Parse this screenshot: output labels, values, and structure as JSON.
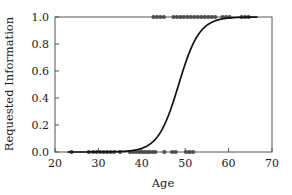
{
  "chart_data": {
    "type": "scatter",
    "title": "",
    "xlabel": "Age",
    "ylabel": "Requested Information",
    "xlim": [
      20,
      70
    ],
    "ylim": [
      0.0,
      1.0
    ],
    "grid": false,
    "legend": null,
    "xticks": [
      "20",
      "30",
      "40",
      "50",
      "60",
      "70"
    ],
    "xtick_values": [
      20,
      30,
      40,
      50,
      60,
      70
    ],
    "yticks": [
      "0.0",
      "0.2",
      "0.4",
      "0.6",
      "0.8",
      "1.0"
    ],
    "ytick_values": [
      0.0,
      0.2,
      0.4,
      0.6,
      0.8,
      1.0
    ],
    "series": [
      {
        "name": "Observed outcomes",
        "type": "scatter",
        "marker": "filled-circle",
        "color": "#4d4d4d",
        "points": [
          [
            23.8,
            0
          ],
          [
            27.8,
            0
          ],
          [
            28.8,
            0
          ],
          [
            29.6,
            0
          ],
          [
            30.4,
            0
          ],
          [
            31.2,
            0
          ],
          [
            32.0,
            0
          ],
          [
            32.8,
            0
          ],
          [
            33.6,
            0
          ],
          [
            35.0,
            0
          ],
          [
            37.3,
            0
          ],
          [
            38.0,
            0
          ],
          [
            38.7,
            0
          ],
          [
            39.4,
            0
          ],
          [
            40.0,
            0
          ],
          [
            40.6,
            0
          ],
          [
            41.2,
            0
          ],
          [
            41.8,
            0
          ],
          [
            42.5,
            0
          ],
          [
            43.1,
            0
          ],
          [
            45.2,
            0
          ],
          [
            47.0,
            0
          ],
          [
            47.8,
            0
          ],
          [
            50.2,
            0
          ],
          [
            51.0,
            0
          ],
          [
            51.8,
            0
          ],
          [
            42.7,
            1
          ],
          [
            43.5,
            1
          ],
          [
            44.3,
            1
          ],
          [
            45.1,
            1
          ],
          [
            47.3,
            1
          ],
          [
            48.1,
            1
          ],
          [
            48.9,
            1
          ],
          [
            49.7,
            1
          ],
          [
            50.5,
            1
          ],
          [
            51.3,
            1
          ],
          [
            52.1,
            1
          ],
          [
            52.9,
            1
          ],
          [
            53.7,
            1
          ],
          [
            54.5,
            1
          ],
          [
            55.3,
            1
          ],
          [
            56.1,
            1
          ],
          [
            56.9,
            1
          ],
          [
            58.6,
            1
          ],
          [
            59.4,
            1
          ],
          [
            60.2,
            1
          ],
          [
            63.0,
            1
          ],
          [
            63.8,
            1
          ],
          [
            64.6,
            1
          ]
        ]
      },
      {
        "name": "Logistic fit",
        "type": "line",
        "color": "#111111",
        "model": "logistic",
        "midpoint_age": 48.5,
        "slope": 0.42,
        "x_range": [
          23.0,
          66.5
        ]
      }
    ]
  }
}
